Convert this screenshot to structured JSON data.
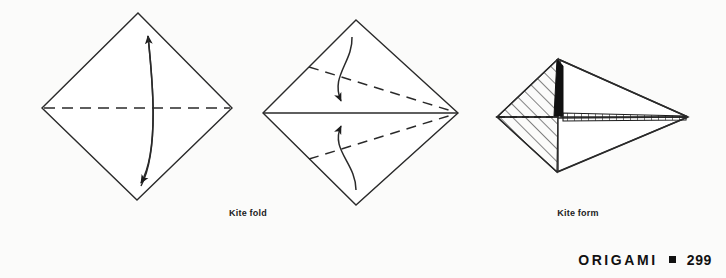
{
  "page": {
    "background_color": "#fbfbfa",
    "ink_color": "#1c1c1c"
  },
  "figures": [
    {
      "id": "kite-fold-step-1",
      "caption": "Kite fold",
      "description": "Square sheet rotated 45 degrees with a horizontal dashed center crease and a double-headed curved arrow spanning top to bottom vertex",
      "shape": "diamond",
      "vertices": {
        "top": [
          138,
          13
        ],
        "left": [
          42,
          108
        ],
        "right": [
          232,
          108
        ],
        "bottom": [
          137,
          200
        ]
      },
      "creases": [
        {
          "type": "valley-dashed",
          "from": [
            42,
            108
          ],
          "to": [
            232,
            108
          ]
        }
      ],
      "arrows": [
        {
          "type": "double-headed-curve",
          "from": [
            141,
            186
          ],
          "to": [
            148,
            33
          ]
        }
      ]
    },
    {
      "id": "kite-fold-step-2",
      "caption": "Kite fold",
      "description": "Diamond with solid horizontal center line and two dashed creases from the left edges to the right vertex, with two curved arrows folding the upper and lower left edges inward",
      "shape": "diamond",
      "vertices": {
        "top": [
          356,
          20
        ],
        "left": [
          263,
          113
        ],
        "right": [
          458,
          113
        ],
        "bottom": [
          356,
          205
        ]
      },
      "creases": [
        {
          "type": "solid",
          "from": [
            263,
            113
          ],
          "to": [
            458,
            113
          ]
        },
        {
          "type": "valley-dashed",
          "from": [
            309,
            67
          ],
          "to": [
            458,
            113
          ]
        },
        {
          "type": "valley-dashed",
          "from": [
            309,
            159
          ],
          "to": [
            458,
            113
          ]
        }
      ],
      "arrows": [
        {
          "type": "curve-down",
          "from": [
            352,
            37
          ],
          "to": [
            341,
            105
          ]
        },
        {
          "type": "curve-up",
          "from": [
            356,
            190
          ],
          "to": [
            341,
            122
          ]
        }
      ]
    },
    {
      "id": "kite-form-result",
      "caption": "Kite form",
      "description": "Completed kite form shown as a long narrow kite shape with diagonal hatching on the left body, a solid black wedge at the top center and a hatched folded edge running to the right point",
      "shape": "kite",
      "vertices": {
        "apex": [
          558,
          59
        ],
        "left": [
          497,
          117
        ],
        "right": [
          688,
          117
        ],
        "bottom": [
          557,
          172
        ]
      },
      "shading": [
        {
          "type": "diagonal-hatch",
          "region": "left-body"
        },
        {
          "type": "solid-black",
          "region": "top-center-wedge"
        },
        {
          "type": "tick-hatch",
          "region": "folded-edge-band"
        }
      ],
      "creases": [
        {
          "type": "valley-dashed",
          "from": [
            497,
            117
          ],
          "to": [
            558,
            117
          ]
        }
      ]
    }
  ],
  "captions": {
    "kite_fold": "Kite fold",
    "kite_form": "Kite form"
  },
  "footer": {
    "title": "ORIGAMI",
    "bullet": "square-bullet",
    "page_number": "299"
  }
}
